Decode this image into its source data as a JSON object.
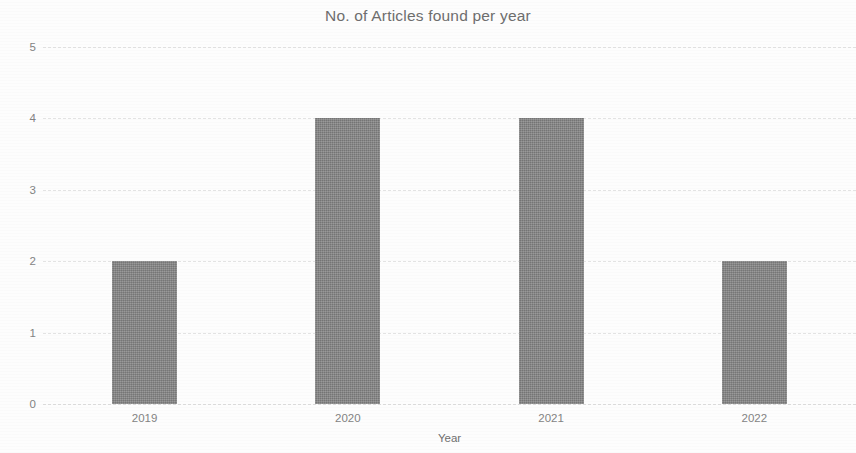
{
  "chart_data": {
    "type": "bar",
    "title": "No. of Articles found per year",
    "xlabel": "Year",
    "ylabel": "No. of articles",
    "categories": [
      "2019",
      "2020",
      "2021",
      "2022"
    ],
    "values": [
      2,
      4,
      4,
      2
    ],
    "series": [
      {
        "name": "No. of articles",
        "values": [
          2,
          4,
          4,
          2
        ]
      }
    ],
    "ylim": [
      0,
      5
    ],
    "yticks": [
      "0",
      "1",
      "2",
      "3",
      "4",
      "5"
    ],
    "ytick_values": [
      0,
      1,
      2,
      3,
      4,
      5
    ],
    "grid": true,
    "grid_axis": "y",
    "grid_style": "dashed",
    "legend": false,
    "legend_position": "none",
    "bar_color": "#838383",
    "grid_color": "#e3e3e3",
    "title_color": "#6e6e6e",
    "tick_label_color": "#838383",
    "axis_label_color": "#6f6f6f",
    "background_color": "#fdfdfd"
  }
}
